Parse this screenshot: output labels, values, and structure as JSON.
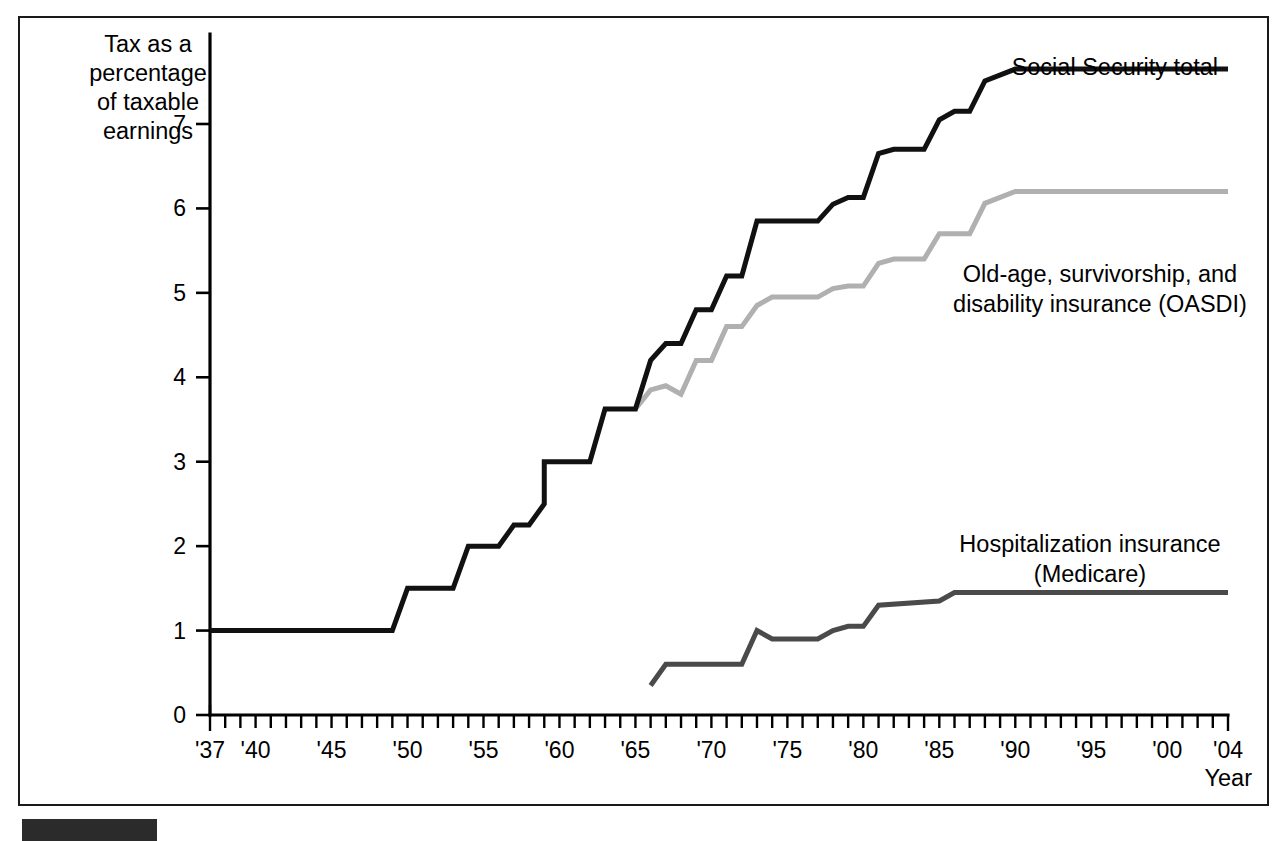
{
  "figure": {
    "frame": {
      "border_color": "#1a1a1a"
    },
    "bottom_bar": {
      "name": "source-bar"
    }
  },
  "axes": {
    "y_title_lines": [
      "Tax as a",
      "percentage",
      "of taxable",
      "earnings"
    ],
    "x_title": "Year",
    "y_ticks": [
      "0",
      "1",
      "2",
      "3",
      "4",
      "5",
      "6",
      "7"
    ],
    "x_ticks": [
      "'37",
      "'40",
      "'45",
      "'50",
      "'55",
      "'60",
      "'65",
      "'70",
      "'75",
      "'80",
      "'85",
      "'90",
      "'95",
      "'00",
      "'04"
    ]
  },
  "annotations": {
    "total": "Social Security total",
    "oasdi_line1": "Old-age, survivorship, and",
    "oasdi_line2": "disability insurance (OASDI)",
    "medicare_line1": "Hospitalization insurance",
    "medicare_line2": "(Medicare)"
  },
  "chart_data": {
    "type": "line",
    "title": "",
    "xlabel": "Year",
    "ylabel": "Tax as a percentage of taxable earnings",
    "xlim": [
      1937,
      2004
    ],
    "ylim": [
      0,
      7.9
    ],
    "grid": false,
    "legend": "inline-annotations",
    "x_tick_values": [
      1937,
      1940,
      1945,
      1950,
      1955,
      1960,
      1965,
      1970,
      1975,
      1980,
      1985,
      1990,
      1995,
      2000,
      2004
    ],
    "y_tick_values": [
      0,
      1,
      2,
      3,
      4,
      5,
      6,
      7
    ],
    "x_minor_tick_step": 1,
    "series": [
      {
        "name": "Social Security total",
        "color": "#111111",
        "width": 5.0,
        "points": [
          [
            1937,
            1.0
          ],
          [
            1949,
            1.0
          ],
          [
            1950,
            1.5
          ],
          [
            1953,
            1.5
          ],
          [
            1954,
            2.0
          ],
          [
            1956,
            2.0
          ],
          [
            1957,
            2.25
          ],
          [
            1958,
            2.25
          ],
          [
            1959,
            2.5
          ],
          [
            1959,
            3.0
          ],
          [
            1962,
            3.0
          ],
          [
            1963,
            3.625
          ],
          [
            1965,
            3.625
          ],
          [
            1966,
            4.2
          ],
          [
            1967,
            4.4
          ],
          [
            1968,
            4.4
          ],
          [
            1969,
            4.8
          ],
          [
            1970,
            4.8
          ],
          [
            1971,
            5.2
          ],
          [
            1972,
            5.2
          ],
          [
            1973,
            5.85
          ],
          [
            1977,
            5.85
          ],
          [
            1978,
            6.05
          ],
          [
            1979,
            6.13
          ],
          [
            1980,
            6.13
          ],
          [
            1981,
            6.65
          ],
          [
            1982,
            6.7
          ],
          [
            1984,
            6.7
          ],
          [
            1985,
            7.05
          ],
          [
            1986,
            7.15
          ],
          [
            1987,
            7.15
          ],
          [
            1988,
            7.51
          ],
          [
            1990,
            7.65
          ],
          [
            2004,
            7.65
          ]
        ]
      },
      {
        "name": "Old-age, survivorship, and disability insurance (OASDI)",
        "color": "#b0b0b0",
        "width": 5.0,
        "points": [
          [
            1965,
            3.625
          ],
          [
            1966,
            3.85
          ],
          [
            1967,
            3.9
          ],
          [
            1968,
            3.8
          ],
          [
            1969,
            4.2
          ],
          [
            1970,
            4.2
          ],
          [
            1971,
            4.6
          ],
          [
            1972,
            4.6
          ],
          [
            1973,
            4.85
          ],
          [
            1974,
            4.95
          ],
          [
            1977,
            4.95
          ],
          [
            1978,
            5.05
          ],
          [
            1979,
            5.08
          ],
          [
            1980,
            5.08
          ],
          [
            1981,
            5.35
          ],
          [
            1982,
            5.4
          ],
          [
            1984,
            5.4
          ],
          [
            1985,
            5.7
          ],
          [
            1986,
            5.7
          ],
          [
            1987,
            5.7
          ],
          [
            1988,
            6.06
          ],
          [
            1990,
            6.2
          ],
          [
            2004,
            6.2
          ]
        ]
      },
      {
        "name": "Hospitalization insurance (Medicare)",
        "color": "#4a4a4a",
        "width": 5.0,
        "points": [
          [
            1966,
            0.35
          ],
          [
            1967,
            0.6
          ],
          [
            1972,
            0.6
          ],
          [
            1973,
            1.0
          ],
          [
            1974,
            0.9
          ],
          [
            1977,
            0.9
          ],
          [
            1978,
            1.0
          ],
          [
            1979,
            1.05
          ],
          [
            1980,
            1.05
          ],
          [
            1981,
            1.3
          ],
          [
            1985,
            1.35
          ],
          [
            1986,
            1.45
          ],
          [
            1988,
            1.45
          ],
          [
            2004,
            1.45
          ]
        ]
      }
    ]
  }
}
